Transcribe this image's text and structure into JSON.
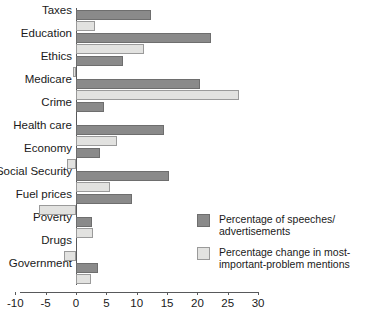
{
  "chart_data": {
    "type": "bar",
    "orientation": "horizontal",
    "title": "",
    "xlabel": "",
    "ylabel": "",
    "xlim": [
      -10,
      30
    ],
    "xticks": [
      -10,
      -5,
      0,
      5,
      10,
      15,
      20,
      25,
      30
    ],
    "xticklabels": [
      "-10",
      "-5",
      "0",
      "5",
      "10",
      "15",
      "20",
      "25",
      "30"
    ],
    "grid": false,
    "legend_position": "center-right",
    "categories": [
      "Taxes",
      "Education",
      "Ethics",
      "Medicare",
      "Crime",
      "Health care",
      "Economy",
      "Social Security",
      "Fuel prices",
      "Poverty",
      "Drugs",
      "Government"
    ],
    "series": [
      {
        "name": "Percentage of speeches/advertisements",
        "color": "#8a8a8a",
        "values": [
          12.3,
          22.3,
          7.8,
          20.4,
          4.6,
          14.5,
          4.0,
          15.3,
          9.2,
          2.6,
          0.0,
          3.6
        ]
      },
      {
        "name": "Percentage change in most-important-problem mentions",
        "color": "#e2e2e0",
        "values": [
          3.1,
          11.2,
          -0.5,
          26.8,
          0.0,
          6.8,
          -1.5,
          5.6,
          -6.1,
          2.8,
          -2.0,
          2.4
        ]
      }
    ]
  },
  "legend": {
    "entries": [
      {
        "label_line1": "Percentage of speeches/",
        "label_line2": "advertisements",
        "swatch": "dark"
      },
      {
        "label_line1": "Percentage change in most-",
        "label_line2": "important-problem mentions",
        "swatch": "light"
      }
    ]
  }
}
